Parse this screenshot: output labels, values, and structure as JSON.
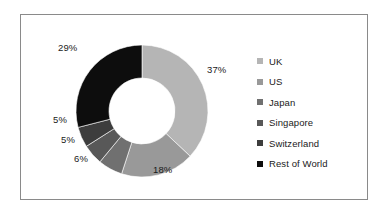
{
  "chart_data": {
    "type": "pie",
    "variant": "donut",
    "title": "",
    "subtitle": "",
    "xlabel": "",
    "ylabel": "",
    "grid": false,
    "legend_position": "right",
    "start_angle_oclock": 12,
    "direction": "clockwise",
    "labels": [
      "UK",
      "US",
      "Japan",
      "Singapore",
      "Switzerland",
      "Rest of World"
    ],
    "values": [
      37,
      18,
      6,
      5,
      5,
      29
    ],
    "value_labels": [
      "37%",
      "18%",
      "6%",
      "5%",
      "5%",
      "29%"
    ],
    "colors": [
      "#b5b5b5",
      "#999999",
      "#707070",
      "#585858",
      "#3d3d3d",
      "#0d0d0d"
    ],
    "slices": [
      {
        "name": "UK",
        "value": 37,
        "label": "37%",
        "color": "#b5b5b5",
        "label_x": 206,
        "label_y": 63
      },
      {
        "name": "US",
        "value": 18,
        "label": "18%",
        "color": "#999999",
        "label_x": 152,
        "label_y": 163
      },
      {
        "name": "Japan",
        "value": 6,
        "label": "6%",
        "color": "#707070",
        "label_x": 73,
        "label_y": 152
      },
      {
        "name": "Singapore",
        "value": 5,
        "label": "5%",
        "color": "#585858",
        "label_x": 60,
        "label_y": 133
      },
      {
        "name": "Switzerland",
        "value": 5,
        "label": "5%",
        "color": "#3d3d3d",
        "label_x": 52,
        "label_y": 113
      },
      {
        "name": "Rest of World",
        "value": 29,
        "label": "29%",
        "color": "#0d0d0d",
        "label_x": 57,
        "label_y": 41
      }
    ],
    "geometry": {
      "center_x": 141,
      "center_y": 110,
      "outer_radius": 66,
      "inner_radius": 33
    }
  },
  "frame": {
    "border_color": "#8a8a8a",
    "background": "#ffffff"
  },
  "legend": {
    "items": [
      {
        "label": "UK",
        "color": "#b5b5b5"
      },
      {
        "label": "US",
        "color": "#999999"
      },
      {
        "label": "Japan",
        "color": "#707070"
      },
      {
        "label": "Singapore",
        "color": "#585858"
      },
      {
        "label": "Switzerland",
        "color": "#3d3d3d"
      },
      {
        "label": "Rest of World",
        "color": "#0d0d0d"
      }
    ]
  }
}
